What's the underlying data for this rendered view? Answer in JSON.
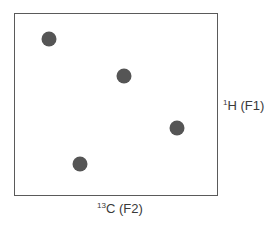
{
  "chart_data": {
    "type": "scatter",
    "title": "",
    "subtitle": "",
    "xlabel": "13C (F2)",
    "ylabel": "1H (F1)",
    "xlabel_parts": {
      "isotope_mass": "13",
      "nucleus": "C",
      "dimension": " (F2)"
    },
    "ylabel_parts": {
      "isotope_mass": "1",
      "nucleus": "H",
      "dimension": " (F1)"
    },
    "xlim": [
      0,
      1
    ],
    "ylim": [
      0,
      1
    ],
    "grid": false,
    "legend": null,
    "ticks": false,
    "points": [
      {
        "id": "peak-1",
        "x": 0.17,
        "y": 0.86
      },
      {
        "id": "peak-2",
        "x": 0.54,
        "y": 0.66
      },
      {
        "id": "peak-3",
        "x": 0.8,
        "y": 0.37
      },
      {
        "id": "peak-4",
        "x": 0.32,
        "y": 0.17
      }
    ],
    "marker_color": "#555555",
    "frame_color": "#5a5a5a"
  },
  "frame": {
    "left": 14,
    "top": 13,
    "width": 204,
    "height": 183
  }
}
